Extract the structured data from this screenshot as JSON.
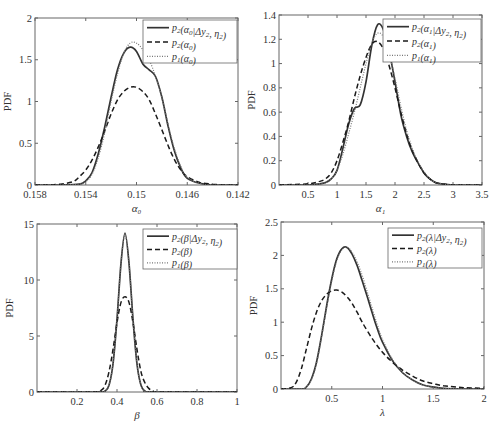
{
  "chart_data": [
    {
      "id": "alpha0",
      "type": "line",
      "xlabel": "α₀",
      "ylabel": "PDF",
      "xlim": [
        0.158,
        0.142
      ],
      "x_reversed": true,
      "ylim": [
        0,
        2
      ],
      "xticks": [
        0.158,
        0.154,
        0.15,
        0.146,
        0.142
      ],
      "xtick_labels": [
        "0.158",
        "0.154",
        "0.15",
        "0.146",
        "0.142"
      ],
      "yticks": [
        0,
        0.5,
        1,
        1.5,
        2
      ],
      "ytick_labels": [
        "0",
        "0.5",
        "1",
        "1.5",
        "2"
      ],
      "legend": [
        "p₂(α₀|Δy₂, η₂)",
        "p₂(α₀)",
        "p₁(α₀)"
      ],
      "legend_position": "upper right",
      "series": [
        {
          "name": "p₂(α₀|Δy₂, η₂)",
          "style": "solid",
          "x": [
            0.158,
            0.156,
            0.1545,
            0.154,
            0.1535,
            0.153,
            0.1525,
            0.152,
            0.1515,
            0.151,
            0.1505,
            0.15,
            0.1495,
            0.149,
            0.1485,
            0.148,
            0.1475,
            0.147,
            0.1465,
            0.146,
            0.145,
            0.144,
            0.142
          ],
          "y": [
            0,
            0,
            0.01,
            0.05,
            0.15,
            0.38,
            0.7,
            1.05,
            1.38,
            1.58,
            1.65,
            1.6,
            1.45,
            1.38,
            1.3,
            1.05,
            0.7,
            0.4,
            0.2,
            0.08,
            0.02,
            0,
            0
          ]
        },
        {
          "name": "p₂(α₀)",
          "style": "dashed",
          "x": [
            0.158,
            0.157,
            0.156,
            0.155,
            0.1545,
            0.154,
            0.1535,
            0.153,
            0.1525,
            0.152,
            0.1515,
            0.151,
            0.1505,
            0.15,
            0.1495,
            0.149,
            0.1485,
            0.148,
            0.1475,
            0.147,
            0.1465,
            0.146,
            0.145,
            0.144,
            0.143,
            0.142
          ],
          "y": [
            0,
            0,
            0.01,
            0.04,
            0.1,
            0.18,
            0.3,
            0.46,
            0.65,
            0.85,
            1.02,
            1.12,
            1.17,
            1.17,
            1.12,
            1.02,
            0.85,
            0.66,
            0.47,
            0.3,
            0.18,
            0.1,
            0.03,
            0.01,
            0,
            0
          ]
        },
        {
          "name": "p₁(α₀)",
          "style": "dotted",
          "x": [
            0.158,
            0.156,
            0.1545,
            0.154,
            0.1535,
            0.153,
            0.1525,
            0.152,
            0.1515,
            0.151,
            0.1505,
            0.15,
            0.1495,
            0.149,
            0.1485,
            0.148,
            0.1475,
            0.147,
            0.1465,
            0.146,
            0.145,
            0.144,
            0.142
          ],
          "y": [
            0,
            0,
            0.01,
            0.04,
            0.13,
            0.33,
            0.63,
            1.0,
            1.33,
            1.58,
            1.7,
            1.7,
            1.62,
            1.5,
            1.3,
            1.05,
            0.72,
            0.43,
            0.22,
            0.09,
            0.02,
            0,
            0
          ]
        }
      ]
    },
    {
      "id": "alpha1",
      "type": "line",
      "xlabel": "α₁",
      "ylabel": "PDF",
      "xlim": [
        0,
        3.5
      ],
      "ylim": [
        0,
        1.4
      ],
      "xticks": [
        0.5,
        1,
        1.5,
        2,
        2.5,
        3,
        3.5
      ],
      "xtick_labels": [
        "0.5",
        "1",
        "1.5",
        "2",
        "2.5",
        "3",
        "3.5"
      ],
      "yticks": [
        0,
        0.2,
        0.4,
        0.6,
        0.8,
        1,
        1.2,
        1.4
      ],
      "ytick_labels": [
        "0",
        "0.2",
        "0.4",
        "0.6",
        "0.8",
        "1",
        "1.2",
        "1.4"
      ],
      "legend": [
        "p₂(α₁|Δy₂, η₂)",
        "p₂(α₁)",
        "p₁(α₁)"
      ],
      "legend_position": "upper right",
      "series": [
        {
          "name": "p₂(α₁|Δy₂, η₂)",
          "style": "solid",
          "x": [
            0,
            0.5,
            0.7,
            0.8,
            0.9,
            1.0,
            1.1,
            1.2,
            1.3,
            1.4,
            1.5,
            1.6,
            1.7,
            1.8,
            1.9,
            2.0,
            2.1,
            2.2,
            2.3,
            2.4,
            2.5,
            2.6,
            2.7,
            2.8,
            3.0,
            3.5
          ],
          "y": [
            0,
            0,
            0.01,
            0.02,
            0.05,
            0.12,
            0.3,
            0.5,
            0.63,
            0.66,
            0.85,
            1.15,
            1.32,
            1.28,
            1.1,
            0.85,
            0.58,
            0.4,
            0.27,
            0.18,
            0.1,
            0.05,
            0.02,
            0.01,
            0,
            0
          ]
        },
        {
          "name": "p₂(α₁)",
          "style": "dashed",
          "x": [
            0,
            0.5,
            0.7,
            0.8,
            0.9,
            1.0,
            1.1,
            1.2,
            1.3,
            1.4,
            1.5,
            1.6,
            1.7,
            1.8,
            1.9,
            2.0,
            2.1,
            2.2,
            2.3,
            2.4,
            2.5,
            2.6,
            2.7,
            2.8,
            3.0,
            3.5
          ],
          "y": [
            0,
            0.01,
            0.03,
            0.05,
            0.1,
            0.2,
            0.35,
            0.52,
            0.72,
            0.9,
            1.05,
            1.16,
            1.18,
            1.12,
            0.98,
            0.8,
            0.6,
            0.42,
            0.28,
            0.18,
            0.1,
            0.05,
            0.02,
            0.01,
            0,
            0
          ]
        },
        {
          "name": "p₁(α₁)",
          "style": "dotted",
          "x": [
            0,
            0.5,
            0.7,
            0.8,
            0.9,
            1.0,
            1.1,
            1.2,
            1.3,
            1.4,
            1.5,
            1.6,
            1.7,
            1.8,
            1.9,
            2.0,
            2.1,
            2.2,
            2.3,
            2.4,
            2.5,
            2.6,
            2.7,
            2.8,
            3.0,
            3.5
          ],
          "y": [
            0,
            0,
            0.01,
            0.02,
            0.05,
            0.12,
            0.25,
            0.42,
            0.6,
            0.8,
            1.0,
            1.17,
            1.25,
            1.22,
            1.08,
            0.88,
            0.65,
            0.45,
            0.3,
            0.19,
            0.11,
            0.05,
            0.02,
            0.01,
            0,
            0
          ]
        }
      ]
    },
    {
      "id": "beta",
      "type": "line",
      "xlabel": "β",
      "ylabel": "PDF",
      "xlim": [
        0,
        1
      ],
      "ylim": [
        0,
        15
      ],
      "xticks": [
        0.2,
        0.4,
        0.6,
        0.8,
        1
      ],
      "xtick_labels": [
        "0.2",
        "0.4",
        "0.6",
        "0.8",
        "1"
      ],
      "yticks": [
        0,
        5,
        10,
        15
      ],
      "ytick_labels": [
        "0",
        "5",
        "10",
        "15"
      ],
      "legend": [
        "p₂(β|Δy₂, η₂)",
        "p₂(β)",
        "p₁(β)"
      ],
      "legend_position": "upper right",
      "series": [
        {
          "name": "p₂(β|Δy₂, η₂)",
          "style": "solid",
          "x": [
            0,
            0.3,
            0.34,
            0.36,
            0.38,
            0.4,
            0.42,
            0.44,
            0.46,
            0.48,
            0.5,
            0.52,
            0.54,
            0.58,
            1
          ],
          "y": [
            0,
            0,
            0.1,
            0.6,
            2.5,
            6.5,
            11.5,
            14.2,
            11.5,
            6.5,
            2.5,
            0.6,
            0.1,
            0,
            0
          ]
        },
        {
          "name": "p₂(β)",
          "style": "dashed",
          "x": [
            0,
            0.28,
            0.32,
            0.34,
            0.36,
            0.38,
            0.4,
            0.42,
            0.44,
            0.46,
            0.48,
            0.5,
            0.52,
            0.54,
            0.56,
            0.58,
            0.62,
            1
          ],
          "y": [
            0,
            0,
            0.15,
            0.6,
            1.8,
            3.8,
            6.2,
            8.0,
            8.5,
            8.0,
            6.2,
            3.8,
            1.8,
            0.8,
            0.3,
            0.1,
            0,
            0
          ]
        },
        {
          "name": "p₁(β)",
          "style": "dotted",
          "x": [
            0,
            0.3,
            0.34,
            0.36,
            0.38,
            0.4,
            0.42,
            0.44,
            0.46,
            0.48,
            0.5,
            0.52,
            0.54,
            0.58,
            1
          ],
          "y": [
            0,
            0,
            0.1,
            0.6,
            2.5,
            6.5,
            11.5,
            14.0,
            11.5,
            6.5,
            2.5,
            0.6,
            0.1,
            0,
            0
          ]
        }
      ]
    },
    {
      "id": "lambda",
      "type": "line",
      "xlabel": "λ",
      "ylabel": "PDF",
      "xlim": [
        0,
        2
      ],
      "ylim": [
        0,
        2.5
      ],
      "xticks": [
        0.5,
        1,
        1.5,
        2
      ],
      "xtick_labels": [
        "0.5",
        "1",
        "1.5",
        "2"
      ],
      "yticks": [
        0,
        0.5,
        1,
        1.5,
        2,
        2.5
      ],
      "ytick_labels": [
        "0",
        "0.5",
        "1",
        "1.5",
        "2",
        "2.5"
      ],
      "legend": [
        "p₂(λ|Δy₂, η₂)",
        "p₂(λ)",
        "p₁(λ)"
      ],
      "legend_position": "upper right",
      "series": [
        {
          "name": "p₂(λ|Δy₂, η₂)",
          "style": "solid",
          "x": [
            0,
            0.2,
            0.25,
            0.3,
            0.35,
            0.4,
            0.45,
            0.5,
            0.55,
            0.6,
            0.65,
            0.7,
            0.75,
            0.8,
            0.85,
            0.9,
            0.95,
            1.0,
            1.1,
            1.2,
            1.3,
            1.4,
            1.5,
            1.6,
            1.8,
            2.0
          ],
          "y": [
            0,
            0,
            0.03,
            0.15,
            0.4,
            0.8,
            1.25,
            1.65,
            1.95,
            2.1,
            2.12,
            2.02,
            1.85,
            1.62,
            1.38,
            1.13,
            0.9,
            0.7,
            0.42,
            0.24,
            0.13,
            0.06,
            0.03,
            0.01,
            0,
            0
          ]
        },
        {
          "name": "p₂(λ)",
          "style": "dashed",
          "x": [
            0,
            0.1,
            0.15,
            0.2,
            0.25,
            0.3,
            0.35,
            0.4,
            0.45,
            0.5,
            0.55,
            0.6,
            0.65,
            0.7,
            0.75,
            0.8,
            0.9,
            1.0,
            1.1,
            1.2,
            1.3,
            1.4,
            1.5,
            1.6,
            1.8,
            2.0
          ],
          "y": [
            0,
            0.02,
            0.1,
            0.3,
            0.6,
            0.9,
            1.15,
            1.32,
            1.42,
            1.47,
            1.48,
            1.45,
            1.38,
            1.28,
            1.15,
            1.0,
            0.75,
            0.55,
            0.4,
            0.28,
            0.19,
            0.12,
            0.08,
            0.05,
            0.02,
            0.01
          ]
        },
        {
          "name": "p₁(λ)",
          "style": "dotted",
          "x": [
            0,
            0.2,
            0.25,
            0.3,
            0.35,
            0.4,
            0.45,
            0.5,
            0.55,
            0.6,
            0.65,
            0.7,
            0.75,
            0.8,
            0.85,
            0.9,
            0.95,
            1.0,
            1.1,
            1.2,
            1.3,
            1.4,
            1.5,
            1.6,
            1.8,
            2.0
          ],
          "y": [
            0,
            0,
            0.03,
            0.14,
            0.38,
            0.78,
            1.22,
            1.62,
            1.92,
            2.08,
            2.12,
            2.05,
            1.9,
            1.7,
            1.45,
            1.2,
            0.96,
            0.74,
            0.44,
            0.25,
            0.13,
            0.06,
            0.03,
            0.01,
            0,
            0
          ]
        }
      ]
    }
  ],
  "panels": [
    {
      "box": [
        35,
        18,
        238,
        185
      ],
      "ylabel": "PDF",
      "xlabel": "α₀",
      "legend_box": [
        143,
        20,
        94,
        43
      ],
      "legend_items": [
        {
          "prefix": "p",
          "sub": "2",
          "args": "(α",
          "argsub": "0",
          "rest": "|Δy",
          "restsub": "2",
          "tail": ", η",
          "tailsub": "2",
          "end": ")"
        },
        {
          "prefix": "p",
          "sub": "2",
          "args": "(α",
          "argsub": "0",
          "end": ")"
        },
        {
          "prefix": "p",
          "sub": "1",
          "args": "(α",
          "argsub": "0",
          "end": ")"
        }
      ]
    },
    {
      "box": [
        279,
        15,
        482,
        185
      ],
      "ylabel": "PDF",
      "xlabel": "α₁",
      "legend_box": [
        383,
        19,
        98,
        43
      ],
      "legend_items": [
        {
          "prefix": "p",
          "sub": "2",
          "args": "(α",
          "argsub": "1",
          "rest": "|Δy",
          "restsub": "2",
          "tail": ", η",
          "tailsub": "2",
          "end": ")"
        },
        {
          "prefix": "p",
          "sub": "2",
          "args": "(α",
          "argsub": "1",
          "end": ")"
        },
        {
          "prefix": "p",
          "sub": "1",
          "args": "(α",
          "argsub": "1",
          "end": ")"
        }
      ]
    },
    {
      "box": [
        37,
        224,
        237,
        392
      ],
      "ylabel": "PDF",
      "xlabel": "β",
      "legend_box": [
        143,
        229,
        94,
        40
      ],
      "legend_items": [
        {
          "prefix": "p",
          "sub": "2",
          "args": "(β",
          "argsub": "",
          "rest": "|Δy",
          "restsub": "2",
          "tail": ", η",
          "tailsub": "2",
          "end": ")"
        },
        {
          "prefix": "p",
          "sub": "2",
          "args": "(β",
          "argsub": "",
          "end": ")"
        },
        {
          "prefix": "p",
          "sub": "1",
          "args": "(β",
          "argsub": "",
          "end": ")"
        }
      ]
    },
    {
      "box": [
        281,
        222,
        484,
        389
      ],
      "ylabel": "PDF",
      "xlabel": "λ",
      "legend_box": [
        388,
        228,
        94,
        40
      ],
      "legend_items": [
        {
          "prefix": "p",
          "sub": "2",
          "args": "(λ",
          "argsub": "",
          "rest": "|Δy",
          "restsub": "2",
          "tail": ", η",
          "tailsub": "2",
          "end": ")"
        },
        {
          "prefix": "p",
          "sub": "2",
          "args": "(λ",
          "argsub": "",
          "end": ")"
        },
        {
          "prefix": "p",
          "sub": "1",
          "args": "(λ",
          "argsub": "",
          "end": ")"
        }
      ]
    }
  ],
  "style": {
    "solid_color": "#333333",
    "dashed_color": "#1a1a1a",
    "dotted_color": "#777777",
    "frame_color": "#666666"
  }
}
